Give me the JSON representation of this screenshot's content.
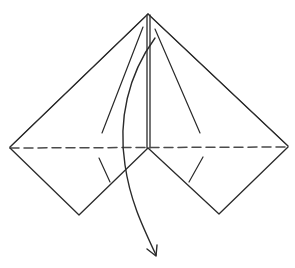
{
  "diagram": {
    "type": "origami-fold-step",
    "colors": {
      "stroke": "#2a2a2a",
      "dash": "#4a4a4a",
      "background": "#ffffff"
    },
    "elements": [
      {
        "name": "outer-left-edge",
        "kind": "double-line"
      },
      {
        "name": "outer-right-edge",
        "kind": "double-line"
      },
      {
        "name": "center-crease",
        "kind": "double-line"
      },
      {
        "name": "valley-fold-line",
        "kind": "dashed-line"
      },
      {
        "name": "left-lower-flap",
        "kind": "polyline"
      },
      {
        "name": "right-lower-flap",
        "kind": "polyline"
      },
      {
        "name": "inner-left-crease",
        "kind": "line"
      },
      {
        "name": "inner-right-crease",
        "kind": "line"
      },
      {
        "name": "fold-down-arrow",
        "kind": "curved-arrow"
      }
    ]
  }
}
